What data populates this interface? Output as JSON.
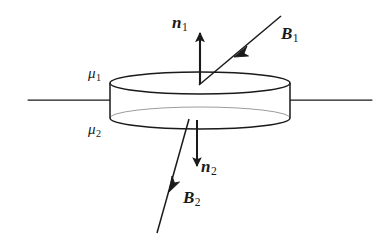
{
  "figure": {
    "type": "physics-diagram",
    "stroke_color": "#1a1a1a",
    "background_color": "#ffffff",
    "labels": {
      "mu_1": {
        "symbol": "μ",
        "subscript": "1",
        "meaning": "permeability-upper-medium"
      },
      "mu_2": {
        "symbol": "μ",
        "subscript": "2",
        "meaning": "permeability-lower-medium"
      },
      "n_1": {
        "symbol": "n",
        "subscript": "1",
        "meaning": "outward-normal-top-face"
      },
      "n_2": {
        "symbol": "n",
        "subscript": "2",
        "meaning": "outward-normal-bottom-face"
      },
      "B_1": {
        "symbol": "B",
        "subscript": "1",
        "meaning": "magnetic-field-upper-medium"
      },
      "B_2": {
        "symbol": "B",
        "subscript": "2",
        "meaning": "magnetic-field-lower-medium"
      }
    },
    "geometry": {
      "pillbox": {
        "center_x": 200,
        "top_ellipse_cy": 83,
        "bottom_ellipse_cy": 118,
        "rx": 90,
        "ry": 11,
        "height": 35
      },
      "interface_line_y": 100,
      "interface_left_x0": 28,
      "interface_left_x1": 110,
      "interface_right_x0": 290,
      "interface_right_x1": 372
    },
    "vectors": [
      {
        "name": "n_1",
        "from": [
          200,
          83
        ],
        "to": [
          200,
          30
        ],
        "direction": "up",
        "arrowhead": "tip"
      },
      {
        "name": "B_1",
        "from": [
          280,
          17
        ],
        "to": [
          200,
          83
        ],
        "direction": "down-left",
        "arrowhead": "midline"
      },
      {
        "name": "n_2",
        "from": [
          197,
          120
        ],
        "to": [
          197,
          172
        ],
        "direction": "down",
        "arrowhead": "tip"
      },
      {
        "name": "B_2",
        "from": [
          188,
          119
        ],
        "to": [
          157,
          232
        ],
        "direction": "down-left",
        "arrowhead": "midline"
      }
    ]
  }
}
